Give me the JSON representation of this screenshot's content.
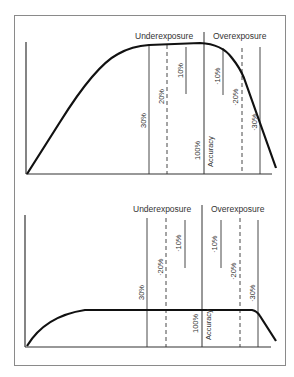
{
  "figure": {
    "panels": [
      {
        "id": "top",
        "header_left": "Underexposure",
        "header_right": "Overexposure",
        "markers": {
          "m30": "30%",
          "m20": "20%",
          "m10": "10%",
          "center": "100%",
          "accuracy": "Accuracy",
          "p10": "·10%",
          "p20": "·20%",
          "p30": "·30%"
        },
        "description": "Curve rising to a narrow peak then dropping steeply under overexposure"
      },
      {
        "id": "bottom",
        "header_left": "Underexposure",
        "header_right": "Overexposure",
        "markers": {
          "m30": "30%",
          "m20": "·20%",
          "m10": "·10%",
          "center": "100%",
          "accuracy": "Accuracy",
          "p10": "·10%",
          "p20": "·20%",
          "p30": "·30%"
        },
        "description": "Curve with wide flat plateau spanning the full exposure range"
      }
    ],
    "colors": {
      "line": "#1a1a1a",
      "frame": "#8a8a8a",
      "text": "#333333"
    }
  }
}
